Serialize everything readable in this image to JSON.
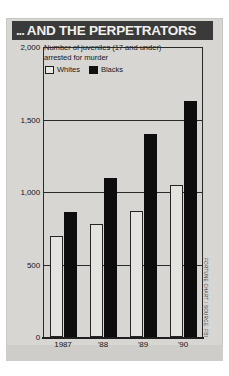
{
  "header": {
    "leading_dots": "...",
    "title": "AND THE PERPETRATORS",
    "banner_color": "#3a3a3a"
  },
  "caption": {
    "line1": "Number of juveniles (17 and under)",
    "line2": "arrested for murder"
  },
  "legend": {
    "items": [
      {
        "label": "Whites",
        "color": "#e5e3df",
        "swatch": "outline"
      },
      {
        "label": "Blacks",
        "color": "#0d0d0d",
        "swatch": "solid"
      }
    ]
  },
  "axis": {
    "y_ticks": [
      "2,000",
      "1,500",
      "1,000",
      "500",
      "0"
    ],
    "x_ticks": [
      "1987",
      "'88",
      "'89",
      "'90"
    ]
  },
  "source": {
    "text": "FORTUNE CHART / SOURCE: FBI"
  },
  "chart_data": {
    "type": "bar",
    "title": "... AND THE PERPETRATORS",
    "subtitle": "Number of juveniles (17 and under) arrested for murder",
    "categories": [
      "1987",
      "'88",
      "'89",
      "'90"
    ],
    "series": [
      {
        "name": "Whites",
        "color": "#e5e3df",
        "values": [
          700,
          780,
          870,
          1050
        ]
      },
      {
        "name": "Blacks",
        "color": "#0d0d0d",
        "values": [
          860,
          1100,
          1400,
          1630
        ]
      }
    ],
    "xlabel": "",
    "ylabel": "",
    "ylim": [
      0,
      2000
    ],
    "ytick_values": [
      0,
      500,
      1000,
      1500,
      2000
    ],
    "grid": true,
    "legend_position": "top-left",
    "source": "FORTUNE CHART / SOURCE: FBI"
  }
}
